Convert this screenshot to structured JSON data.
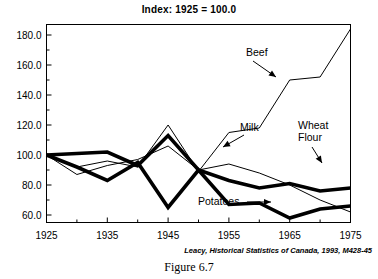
{
  "figure": {
    "caption": "Figure 6.7",
    "source_note": "Leacy, Historical Statistics of Canada, 1993, M428-45"
  },
  "chart_data": {
    "type": "line",
    "title": "Index: 1925 = 100.0",
    "xlabel": "",
    "ylabel": "",
    "xlim": [
      1925,
      1975
    ],
    "ylim": [
      55,
      187
    ],
    "grid": false,
    "legend": "annotations-on-lines",
    "x_major_ticks": [
      1925,
      1935,
      1945,
      1955,
      1965,
      1975
    ],
    "x_minor_ticks": [
      1930,
      1940,
      1950,
      1960,
      1970
    ],
    "x_tick_labels": [
      "1925",
      "1935",
      "1945",
      "1955",
      "1965",
      "1975"
    ],
    "y_major_ticks": [
      60,
      80,
      100,
      120,
      140,
      160,
      180
    ],
    "y_minor_ticks": [
      70,
      90,
      110,
      130,
      150,
      170
    ],
    "y_tick_labels": [
      "60.0",
      "80.0",
      "100.0",
      "120.0",
      "140.0",
      "160.0",
      "180.0"
    ],
    "x": [
      1925,
      1930,
      1935,
      1940,
      1945,
      1950,
      1955,
      1960,
      1965,
      1970,
      1975
    ],
    "series": [
      {
        "name": "Beef",
        "style": "thin",
        "color": "#000000",
        "label_text": "Beef",
        "values": [
          100,
          92,
          96,
          92,
          120,
          89,
          115,
          118,
          150,
          152,
          184
        ]
      },
      {
        "name": "Milk",
        "style": "thin",
        "color": "#000000",
        "label_text": "Milk",
        "values": [
          100,
          87,
          93,
          97,
          106,
          90,
          94,
          88,
          80,
          70,
          62
        ]
      },
      {
        "name": "Wheat Flour",
        "style": "thick",
        "color": "#000000",
        "label_text": "Wheat Flour",
        "label_line1": "Wheat",
        "label_line2": "Flour",
        "values": [
          100,
          101,
          102,
          93,
          113,
          90,
          83,
          78,
          81,
          76,
          78
        ]
      },
      {
        "name": "Potatoes",
        "style": "thick",
        "color": "#000000",
        "label_text": "Potatoes",
        "values": [
          100,
          92,
          83,
          95,
          65,
          90,
          67,
          68,
          58,
          64,
          66
        ]
      }
    ],
    "annotations": [
      {
        "text": "Beef",
        "target_x": 1965,
        "target_y": 150
      },
      {
        "text": "Milk",
        "target_x": 1955,
        "target_y": 94
      },
      {
        "text": "Wheat Flour",
        "target_x": 1970,
        "target_y": 76
      },
      {
        "text": "Potatoes",
        "target_x": 1965,
        "target_y": 58
      }
    ]
  }
}
